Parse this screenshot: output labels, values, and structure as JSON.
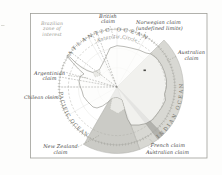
{
  "map": {
    "title": "Antarctic territorial claims map",
    "region_labels": {
      "brazilian": {
        "line1": "Brazilian",
        "line2": "zone of interest"
      },
      "british": {
        "line1": "British",
        "line2": "claim"
      },
      "norwegian": {
        "line1": "Norwegian claim",
        "line2": "(undefined limits)"
      },
      "australian_east": {
        "line1": "Australian",
        "line2": "claim"
      },
      "argentinian": {
        "line1": "Argentinian",
        "line2": "claim"
      },
      "chilean": "Chilean claim",
      "new_zealand": {
        "line1": "New Zealand",
        "line2": "claim"
      },
      "french": "French claim",
      "australian_south": "Australian claim"
    },
    "ocean_labels": {
      "atlantic": "ATLANTIC OCEAN",
      "pacific": "PACIFIC OCEAN",
      "indian": "INDIAN OCEAN"
    },
    "graticule": {
      "antarctic_circle": "Antarctic Circle"
    },
    "colors": {
      "australian_claim": "#d8d8d3",
      "french_claim": "#b2b2ad",
      "new_zealand_claim": "#cbcbc6",
      "land": "#fcfcfa",
      "coastline": "#8b8b85",
      "ice_shelf": "#e9e9e5",
      "frame_border": "#9e9e98",
      "label_text": "#44443f"
    }
  }
}
